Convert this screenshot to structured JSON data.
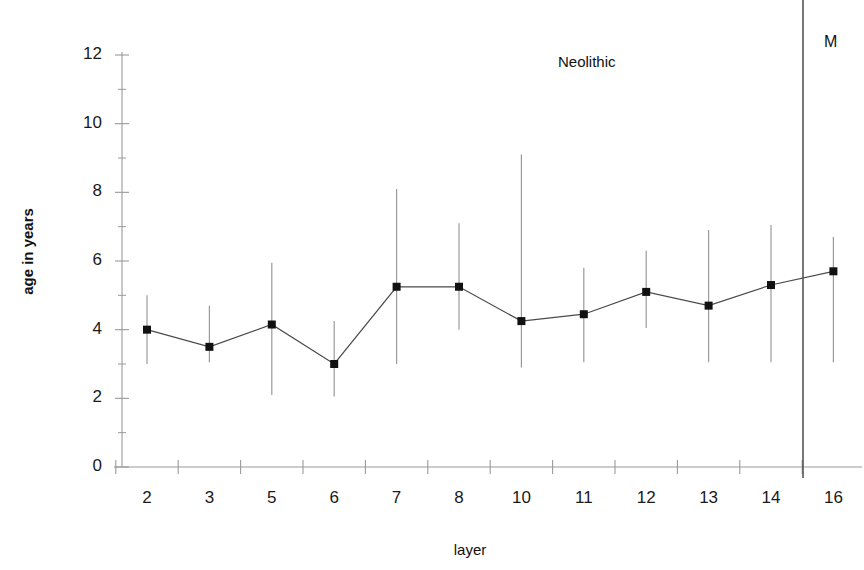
{
  "chart_data": {
    "type": "line",
    "title": "",
    "xlabel": "layer",
    "ylabel": "age in years",
    "categories": [
      "2",
      "3",
      "5",
      "6",
      "7",
      "8",
      "10",
      "11",
      "12",
      "13",
      "14",
      "16"
    ],
    "values": [
      4.0,
      3.5,
      4.15,
      3.0,
      5.25,
      5.25,
      4.25,
      4.45,
      5.1,
      4.7,
      5.3,
      5.7
    ],
    "error_low": [
      3.0,
      3.05,
      2.1,
      2.05,
      3.0,
      4.0,
      2.9,
      3.05,
      4.05,
      3.05,
      3.05,
      3.05
    ],
    "error_high": [
      5.0,
      4.7,
      5.95,
      4.25,
      8.1,
      7.1,
      9.1,
      5.8,
      6.3,
      6.9,
      7.05,
      6.7
    ],
    "ylim": [
      0,
      12
    ],
    "ytick_values": [
      0,
      2,
      4,
      6,
      8,
      10,
      12
    ],
    "ytick_labels": [
      "0",
      "2",
      "4",
      "6",
      "8",
      "10",
      "12"
    ],
    "yminor_values": [
      1,
      3,
      5,
      7,
      9,
      11
    ],
    "grid": false,
    "legend": "none",
    "marker": "square",
    "annotations": [
      {
        "name": "neolithic",
        "text": "Neolithic",
        "x_px": 558,
        "y_px": 53
      },
      {
        "name": "mesolithic",
        "text": "M",
        "x_px": 824,
        "y_px": 33
      }
    ],
    "divider": {
      "name": "period-divider",
      "x_px": 803,
      "y_top_px": 0,
      "y_bottom_px": 478
    }
  },
  "axes": {
    "y_title": "age in years",
    "x_title": "layer"
  },
  "colors": {
    "axis": "#9a9a9a",
    "line": "#4a4a4a",
    "marker": "#111111",
    "error": "#9a9a9a",
    "text": "#1a1a1a",
    "divider": "#555555",
    "background": "#ffffff"
  }
}
